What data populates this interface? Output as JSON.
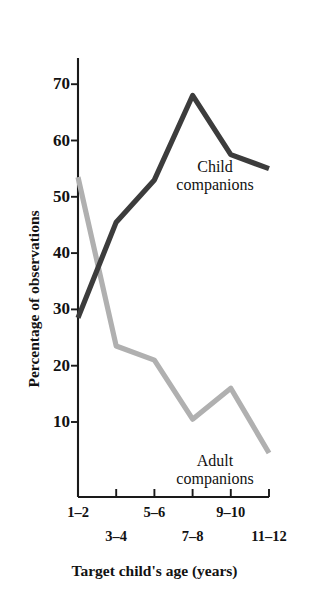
{
  "chart_data": {
    "type": "line",
    "title": "",
    "xlabel": "Target child's age (years)",
    "ylabel": "Percentage of observations",
    "categories": [
      "1–2",
      "3–4",
      "5–6",
      "7–8",
      "9–10",
      "11–12"
    ],
    "ylim": [
      0,
      72
    ],
    "yticks": [
      10,
      20,
      30,
      40,
      50,
      60,
      70
    ],
    "ytick_labels": [
      "10",
      "20",
      "30",
      "40",
      "50",
      "60",
      "70"
    ],
    "grid": false,
    "legend_position": "inline-annotation",
    "series": [
      {
        "name": "Child companions",
        "color": "#3c3c3c",
        "values": [
          28.5,
          45.5,
          53.0,
          68.0,
          57.5,
          55.0
        ]
      },
      {
        "name": "Adult companions",
        "color": "#b0b0b0",
        "values": [
          53.5,
          23.5,
          21.0,
          10.5,
          16.0,
          4.5
        ]
      }
    ],
    "annotations": [
      {
        "text_line1": "Child",
        "text_line2": "companions"
      },
      {
        "text_line1": "Adult",
        "text_line2": "companions"
      }
    ]
  },
  "axes": {
    "y_title": "Percentage of observations",
    "x_title": "Target child's age (years)",
    "y_tick_labels": [
      "70",
      "60",
      "50",
      "40",
      "30",
      "20",
      "10"
    ],
    "x_tick_labels": [
      "1–2",
      "3–4",
      "5–6",
      "7–8",
      "9–10",
      "11–12"
    ]
  },
  "annotations": {
    "child_line1": "Child",
    "child_line2": "companions",
    "adult_line1": "Adult",
    "adult_line2": "companions"
  },
  "colors": {
    "child_series": "#3c3c3c",
    "adult_series": "#b0b0b0",
    "axis": "#1a1a1a",
    "background": "#ffffff",
    "text": "#121212"
  }
}
